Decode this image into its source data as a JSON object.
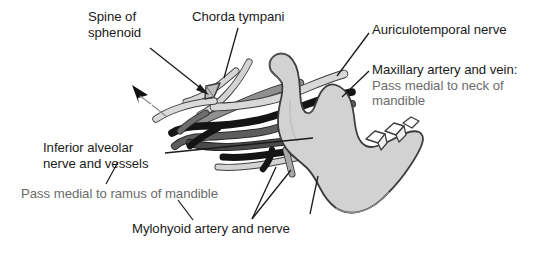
{
  "figure": {
    "background_color": "#ffffff",
    "width": 548,
    "height": 255
  },
  "colors": {
    "label_text": "#1a1a1a",
    "sub_label_text": "#6b6b6b",
    "leader_line": "#1a1a1a",
    "bone_fill": "#d2d2d2",
    "bone_outline": "#3c3c3c",
    "tooth_fill": "#ffffff",
    "vessel_light": "#cfcfcf",
    "vessel_mid": "#9a9a9a",
    "vessel_dark": "#5a5a5a",
    "vessel_black": "#141414",
    "arrow": "#111111"
  },
  "labels": [
    {
      "id": "spine-of-sphenoid",
      "name": "spine-of-sphenoid-label",
      "lines": [
        "Spine of",
        "sphenoid"
      ],
      "line1": "Spine of",
      "line2": "sphenoid",
      "style": "main"
    },
    {
      "id": "chorda-tympani",
      "name": "chorda-tympani-label",
      "line1": "Chorda tympani",
      "style": "main"
    },
    {
      "id": "auriculotemporal-nerve",
      "name": "auriculotemporal-nerve-label",
      "line1": "Auriculotemporal nerve",
      "style": "main"
    },
    {
      "id": "maxillary-artery-and-vein",
      "name": "maxillary-artery-vein-label",
      "line1": "Maxillary artery and vein:",
      "line2": "Pass medial to neck of",
      "line3": "mandible",
      "style": "main-with-sub"
    },
    {
      "id": "inferior-alveolar",
      "name": "inferior-alveolar-label",
      "line1": "Inferior alveolar",
      "line2": "nerve and vessels",
      "style": "main"
    },
    {
      "id": "pass-medial-ramus",
      "name": "pass-medial-ramus-label",
      "line1": "Pass medial to ramus of mandible",
      "style": "sub"
    },
    {
      "id": "mylohyoid-artery-and-nerve",
      "name": "mylohyoid-artery-nerve-label",
      "line1": "Mylohyoid artery and nerve",
      "style": "main"
    }
  ],
  "label_text": {
    "spine_line1": "Spine of",
    "spine_line2": "sphenoid",
    "chorda": "Chorda tympani",
    "auriculotemporal": "Auriculotemporal nerve",
    "maxillary_main": "Maxillary artery and vein:",
    "maxillary_sub1": "Pass medial to neck of",
    "maxillary_sub2": "mandible",
    "inferior_line1": "Inferior alveolar",
    "inferior_line2": "nerve and vessels",
    "ramus_sub": "Pass medial to ramus of mandible",
    "mylohyoid": "Mylohyoid artery and nerve"
  },
  "structures": [
    {
      "name": "mandible",
      "description": "Right mandible seen from medial aspect: condyle, neck, coronoid process, mandibular notch, ramus and body with molar teeth",
      "fill": "#d2d2d2"
    },
    {
      "name": "spine-of-sphenoid",
      "description": "Small pointed bony wedge at upper left of vessel bundle",
      "fill": "#bdbdbd"
    },
    {
      "name": "chorda-tympani-nerve",
      "description": "Pale slender nerve descending across the bundle",
      "fill": "#cfcfcf"
    },
    {
      "name": "auriculotemporal-nerve",
      "description": "Pale tube passing behind the neck of the mandible",
      "fill": "#cfcfcf"
    },
    {
      "name": "maxillary-artery",
      "description": "Black vessel passing medial to the neck of the mandible",
      "fill": "#141414"
    },
    {
      "name": "maxillary-vein",
      "description": "Dark grey vessel accompanying the maxillary artery",
      "fill": "#5a5a5a"
    },
    {
      "name": "inferior-alveolar-nerve-and-vessels",
      "description": "Bundle passing medial to the ramus toward the mandibular foramen",
      "fill": "#5a5a5a"
    },
    {
      "name": "mylohyoid-artery-and-nerve",
      "description": "Branches descending onto the mylohyoid groove",
      "fill": "#9a9a9a"
    }
  ],
  "annotations": [
    {
      "name": "direction-arrow",
      "description": "Black arrowhead with thin tail pointing superolaterally away from the bundle"
    }
  ]
}
